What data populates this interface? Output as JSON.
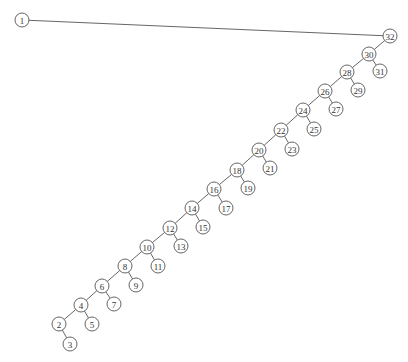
{
  "diagram": {
    "type": "binary-tree",
    "background": "#ffffff",
    "stroke_color": "#555555",
    "node_radius": 7,
    "nodes": [
      {
        "id": "1",
        "label": "1",
        "x": 22,
        "y": 20
      },
      {
        "id": "32",
        "label": "32",
        "x": 390,
        "y": 36
      },
      {
        "id": "30",
        "label": "30",
        "x": 369,
        "y": 54
      },
      {
        "id": "31",
        "label": "31",
        "x": 380,
        "y": 71
      },
      {
        "id": "28",
        "label": "28",
        "x": 347,
        "y": 72
      },
      {
        "id": "29",
        "label": "29",
        "x": 358,
        "y": 90
      },
      {
        "id": "26",
        "label": "26",
        "x": 325,
        "y": 91
      },
      {
        "id": "27",
        "label": "27",
        "x": 336,
        "y": 109
      },
      {
        "id": "24",
        "label": "24",
        "x": 303,
        "y": 110
      },
      {
        "id": "25",
        "label": "25",
        "x": 314,
        "y": 129
      },
      {
        "id": "22",
        "label": "22",
        "x": 281,
        "y": 130
      },
      {
        "id": "23",
        "label": "23",
        "x": 292,
        "y": 149
      },
      {
        "id": "20",
        "label": "20",
        "x": 259,
        "y": 150
      },
      {
        "id": "21",
        "label": "21",
        "x": 270,
        "y": 168
      },
      {
        "id": "18",
        "label": "18",
        "x": 237,
        "y": 170
      },
      {
        "id": "19",
        "label": "19",
        "x": 248,
        "y": 188
      },
      {
        "id": "16",
        "label": "16",
        "x": 214,
        "y": 189
      },
      {
        "id": "17",
        "label": "17",
        "x": 226,
        "y": 208
      },
      {
        "id": "14",
        "label": "14",
        "x": 192,
        "y": 208
      },
      {
        "id": "15",
        "label": "15",
        "x": 203,
        "y": 227
      },
      {
        "id": "12",
        "label": "12",
        "x": 170,
        "y": 228
      },
      {
        "id": "13",
        "label": "13",
        "x": 181,
        "y": 246
      },
      {
        "id": "10",
        "label": "10",
        "x": 147,
        "y": 247
      },
      {
        "id": "11",
        "label": "11",
        "x": 158,
        "y": 266
      },
      {
        "id": "8",
        "label": "8",
        "x": 125,
        "y": 266
      },
      {
        "id": "9",
        "label": "9",
        "x": 136,
        "y": 285
      },
      {
        "id": "6",
        "label": "6",
        "x": 102,
        "y": 286
      },
      {
        "id": "7",
        "label": "7",
        "x": 114,
        "y": 304
      },
      {
        "id": "4",
        "label": "4",
        "x": 81,
        "y": 305
      },
      {
        "id": "5",
        "label": "5",
        "x": 92,
        "y": 324
      },
      {
        "id": "2",
        "label": "2",
        "x": 59,
        "y": 324
      },
      {
        "id": "3",
        "label": "3",
        "x": 70,
        "y": 344
      }
    ],
    "edges": [
      [
        "1",
        "32"
      ],
      [
        "32",
        "30"
      ],
      [
        "30",
        "28"
      ],
      [
        "30",
        "31"
      ],
      [
        "28",
        "26"
      ],
      [
        "28",
        "29"
      ],
      [
        "26",
        "24"
      ],
      [
        "26",
        "27"
      ],
      [
        "24",
        "22"
      ],
      [
        "24",
        "25"
      ],
      [
        "22",
        "20"
      ],
      [
        "22",
        "23"
      ],
      [
        "20",
        "18"
      ],
      [
        "20",
        "21"
      ],
      [
        "18",
        "16"
      ],
      [
        "18",
        "19"
      ],
      [
        "16",
        "14"
      ],
      [
        "16",
        "17"
      ],
      [
        "14",
        "12"
      ],
      [
        "14",
        "15"
      ],
      [
        "12",
        "10"
      ],
      [
        "12",
        "13"
      ],
      [
        "10",
        "8"
      ],
      [
        "10",
        "11"
      ],
      [
        "8",
        "6"
      ],
      [
        "8",
        "9"
      ],
      [
        "6",
        "4"
      ],
      [
        "6",
        "7"
      ],
      [
        "4",
        "2"
      ],
      [
        "4",
        "5"
      ],
      [
        "2",
        "3"
      ]
    ]
  }
}
